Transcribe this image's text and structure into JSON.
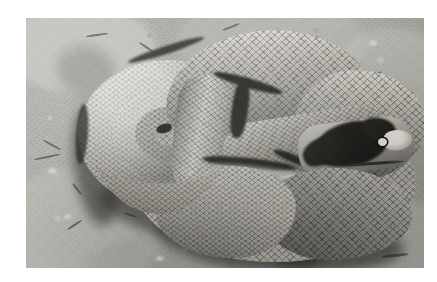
{
  "image": {
    "kind": "photograph",
    "medium": "black-and-white photograph",
    "subject": "snake",
    "subject_description": "A thick-bodied snake coiled in a figure-eight / double loop on bare sandy ground, viewed from above",
    "scene": "dry sandy dirt ground with small twigs and pebbles",
    "orientation": "landscape",
    "border": {
      "style": "solid white mat border",
      "color": "#ffffff"
    },
    "canvas": {
      "width_px": 437,
      "height_px": 282
    },
    "photo_area": {
      "left_px": 26,
      "top_px": 18,
      "width_px": 398,
      "height_px": 250
    },
    "palette": {
      "background_white": "#ffffff",
      "ground_light": "#b3b2ac",
      "ground_mid": "#a3a29d",
      "ground_dark": "#8e8d87",
      "snake_highlight": "#dedcd4",
      "snake_mid": "#a9a7a0",
      "snake_shadow": "#5e5c56",
      "marking_black": "#14130f",
      "twig_dark": "#4c4a45"
    },
    "features": [
      {
        "name": "upper-coil",
        "description": "Left coil with tail tip tucked into the centre of the spiral"
      },
      {
        "name": "tail-tip",
        "description": "Small dark tail tip at the centre of the left spiral"
      },
      {
        "name": "s-curve",
        "description": "Body rises into an S-shaped bend across the top of the frame"
      },
      {
        "name": "lower-coil",
        "description": "Large lower body loop filling the bottom-right of the frame"
      },
      {
        "name": "head",
        "description": "Head at right of frame with a large dark blotch marking and pale snout"
      },
      {
        "name": "eye",
        "description": "Dark eye within the head blotch"
      },
      {
        "name": "scale-texture",
        "description": "Diamond keeled-scale pattern across the whole body"
      },
      {
        "name": "cast-shadow",
        "description": "Soft dark shadow cast on the ground along the lower-left of the coils"
      }
    ],
    "alt_text": "Black-and-white photograph of a heavy-bodied snake coiled in a figure-eight on sandy ground, its head at the right bearing a large dark blotch."
  }
}
